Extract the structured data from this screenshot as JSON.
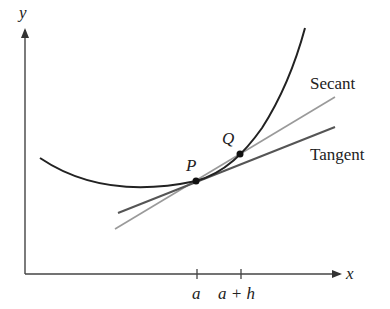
{
  "diagram": {
    "axes": {
      "x_label": "x",
      "y_label": "y"
    },
    "points": [
      {
        "name": "P",
        "label": "P",
        "x_tick": "a"
      },
      {
        "name": "Q",
        "label": "Q",
        "x_tick": "a + h"
      }
    ],
    "lines": [
      {
        "name": "secant",
        "label": "Secant",
        "color": "#9a9a9a"
      },
      {
        "name": "tangent",
        "label": "Tangent",
        "color": "#555555"
      }
    ],
    "curve_color": "#222222",
    "ticks": {
      "a": "a",
      "a_plus_h": "a + h"
    }
  }
}
